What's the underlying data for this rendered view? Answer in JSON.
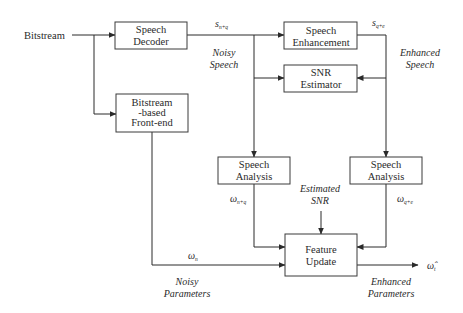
{
  "diagram": {
    "type": "block-diagram",
    "input": {
      "label": "Bitstream"
    },
    "blocks": {
      "speech_decoder": {
        "line1": "Speech",
        "line2": "Decoder"
      },
      "speech_enhancement": {
        "line1": "Speech",
        "line2": "Enhancement"
      },
      "snr_estimator": {
        "line1": "SNR",
        "line2": "Estimator"
      },
      "frontend": {
        "line1": "Bitstream",
        "line2": "-based",
        "line3": "Front-end"
      },
      "speech_analysis_noisy": {
        "line1": "Speech",
        "line2": "Analysis"
      },
      "speech_analysis_enhanced": {
        "line1": "Speech",
        "line2": "Analysis"
      },
      "feature_update": {
        "line1": "Feature",
        "line2": "Update"
      }
    },
    "signals": {
      "noisy_speech_symbol": "s",
      "noisy_speech_sub": "n+q",
      "enhanced_speech_symbol": "s",
      "enhanced_speech_sub": "q+e",
      "omega_noisy_analysis_symbol": "ω",
      "omega_noisy_analysis_sub": "n+q",
      "omega_enhanced_analysis_symbol": "ω",
      "omega_enhanced_analysis_sub": "q+e",
      "omega_noisy_params_symbol": "ω",
      "omega_noisy_params_sub": "n",
      "output_symbol": "ω̂",
      "output_sub": "t"
    },
    "annotations": {
      "noisy_speech_line1": "Noisy",
      "noisy_speech_line2": "Speech",
      "enhanced_speech_line1": "Enhanced",
      "enhanced_speech_line2": "Speech",
      "estimated_snr_line1": "Estimated",
      "estimated_snr_line2": "SNR",
      "noisy_params_line1": "Noisy",
      "noisy_params_line2": "Parameters",
      "enhanced_params_line1": "Enhanced",
      "enhanced_params_line2": "Parameters"
    },
    "edges": [
      {
        "from": "Bitstream",
        "to": "Speech Decoder"
      },
      {
        "from": "Bitstream",
        "to": "Bitstream-based Front-end"
      },
      {
        "from": "Speech Decoder",
        "to": "Speech Enhancement",
        "label": "s_{n+q}"
      },
      {
        "from": "Speech Decoder",
        "to": "SNR Estimator"
      },
      {
        "from": "Speech Decoder",
        "to": "Speech Analysis (noisy)"
      },
      {
        "from": "Speech Enhancement",
        "to": "SNR Estimator",
        "label": "s_{q+e}"
      },
      {
        "from": "Speech Enhancement",
        "to": "Speech Analysis (enhanced)"
      },
      {
        "from": "Speech Analysis (noisy)",
        "to": "Feature Update",
        "label": "ω_{n+q}"
      },
      {
        "from": "Speech Analysis (enhanced)",
        "to": "Feature Update",
        "label": "ω_{q+e}"
      },
      {
        "from": "SNR Estimator",
        "to": "Feature Update",
        "label": "Estimated SNR"
      },
      {
        "from": "Bitstream-based Front-end",
        "to": "Feature Update",
        "label": "ω_n"
      },
      {
        "from": "Feature Update",
        "to": "output",
        "label": "ω̂_t"
      }
    ]
  }
}
